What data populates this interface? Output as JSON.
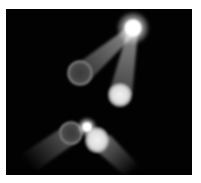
{
  "image": {
    "description": "Spotlight light-beam effects on black background",
    "background_color": "#020202",
    "border_color": "#ffffff",
    "elements": [
      {
        "type": "flare",
        "name": "top-flare"
      },
      {
        "type": "ring-ball",
        "name": "upper-left-ring"
      },
      {
        "type": "glow-ball",
        "name": "upper-right-glow"
      },
      {
        "type": "ring-ball",
        "name": "lower-left-ring"
      },
      {
        "type": "flare",
        "name": "lower-flare"
      },
      {
        "type": "glow-ball",
        "name": "lower-right-glow"
      }
    ]
  }
}
